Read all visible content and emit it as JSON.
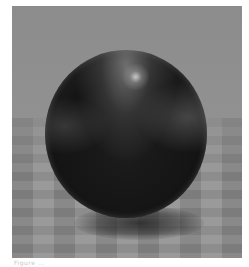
{
  "scene": {
    "description": "Dark glossy sphere resting above a gray checkered floor with a soft shadow beneath",
    "colors": {
      "backdrop": "#8c8c8c",
      "floor_light": "#a3a3a3",
      "floor_dark": "#868686",
      "sphere": "#161616",
      "highlight": "#dcdcdc"
    }
  },
  "caption": {
    "text": "Figure ..."
  }
}
